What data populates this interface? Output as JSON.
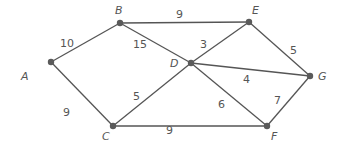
{
  "diagram": {
    "type": "weighted-undirected-graph",
    "colors": {
      "edge": "#555555",
      "node": "#5a5a5a",
      "text": "#555555",
      "background": "#ffffff"
    },
    "nodes": [
      {
        "id": "A",
        "label": "A",
        "x": 51,
        "y": 62,
        "lx": 21,
        "ly": 80
      },
      {
        "id": "B",
        "label": "B",
        "x": 120,
        "y": 23,
        "lx": 115,
        "ly": 14
      },
      {
        "id": "C",
        "label": "C",
        "x": 113,
        "y": 126,
        "lx": 102,
        "ly": 140
      },
      {
        "id": "D",
        "label": "D",
        "x": 191,
        "y": 63,
        "lx": 170,
        "ly": 67
      },
      {
        "id": "E",
        "label": "E",
        "x": 249,
        "y": 22,
        "lx": 252,
        "ly": 14
      },
      {
        "id": "F",
        "label": "F",
        "x": 267,
        "y": 126,
        "lx": 271,
        "ly": 140
      },
      {
        "id": "G",
        "label": "G",
        "x": 310,
        "y": 76,
        "lx": 318,
        "ly": 80
      }
    ],
    "edges": [
      {
        "from": "A",
        "to": "B",
        "weight": "10",
        "lx": 60,
        "ly": 47
      },
      {
        "from": "A",
        "to": "C",
        "weight": "9",
        "lx": 63,
        "ly": 116
      },
      {
        "from": "B",
        "to": "E",
        "weight": "9",
        "lx": 176,
        "ly": 18
      },
      {
        "from": "B",
        "to": "D",
        "weight": "15",
        "lx": 133,
        "ly": 48
      },
      {
        "from": "D",
        "to": "E",
        "weight": "3",
        "lx": 200,
        "ly": 48
      },
      {
        "from": "D",
        "to": "G",
        "weight": "4",
        "lx": 243,
        "ly": 83
      },
      {
        "from": "D",
        "to": "C",
        "weight": "5",
        "lx": 133,
        "ly": 100
      },
      {
        "from": "D",
        "to": "F",
        "weight": "6",
        "lx": 218,
        "ly": 108
      },
      {
        "from": "E",
        "to": "G",
        "weight": "5",
        "lx": 290,
        "ly": 54
      },
      {
        "from": "G",
        "to": "F",
        "weight": "7",
        "lx": 274,
        "ly": 104
      },
      {
        "from": "C",
        "to": "F",
        "weight": "9",
        "lx": 166,
        "ly": 134
      }
    ]
  }
}
